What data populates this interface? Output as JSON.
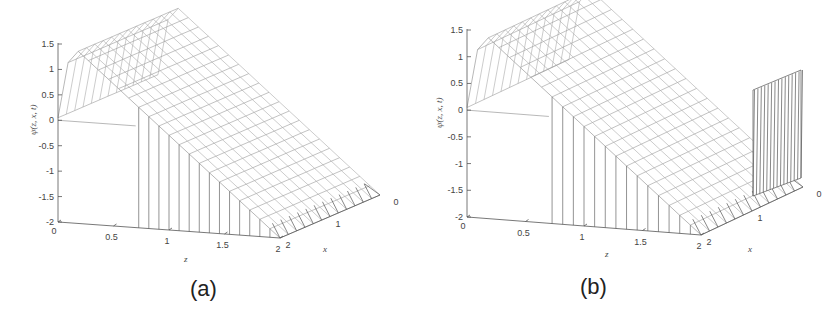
{
  "chart_data": [
    {
      "type": "surface",
      "panel_label": "(a)",
      "title": "",
      "zlabel": "ψ(z, x, t)",
      "xlabel": "z",
      "ylabel": "x",
      "z_axis_ticks": [
        "1.5",
        "1",
        "0.5",
        "0",
        "-0.5",
        "-1",
        "-1.5",
        "-2"
      ],
      "z_range": [
        -2,
        1.5
      ],
      "x_axis_ticks": [
        "0",
        "0.5",
        "1",
        "1.5",
        "2"
      ],
      "x_range": [
        0,
        2
      ],
      "depth_axis_ticks": [
        "2",
        "1",
        "0"
      ],
      "depth_range": [
        0,
        2
      ],
      "description": "Wireframe surface: flat plateau near ψ≈1.5 at small z falling linearly to about ψ≈-2 at z≈2, with a ramp front face; uniform along x."
    },
    {
      "type": "surface",
      "panel_label": "(b)",
      "title": "",
      "zlabel": "ψ(z, x, t)",
      "xlabel": "z",
      "ylabel": "x",
      "z_axis_ticks": [
        "1.5",
        "1",
        "0.5",
        "0",
        "-0.5",
        "-1",
        "-1.5",
        "-2"
      ],
      "z_range": [
        -2,
        1.5
      ],
      "x_axis_ticks": [
        "0",
        "0.5",
        "1",
        "1.5",
        "2"
      ],
      "x_range": [
        0,
        2
      ],
      "depth_axis_ticks": [
        "2",
        "1",
        "0"
      ],
      "depth_range": [
        0,
        2
      ],
      "description": "Same wireframe surface as (a) but with a vertical spike near z=2 for x between 0 and 1 reaching about ψ≈0.5-1."
    }
  ],
  "captions": {
    "a": "(a)",
    "b": "(b)"
  },
  "axes": {
    "zlabel": "ψ(z, x, t)",
    "xlabel": "z",
    "ylabel": "x",
    "z_ticks": [
      "1.5",
      "1",
      "0.5",
      "0",
      "-0.5",
      "-1",
      "-1.5",
      "-2"
    ],
    "x_ticks": [
      "0",
      "0.5",
      "1",
      "1.5",
      "2"
    ],
    "depth_ticks": [
      "2",
      "1",
      "0"
    ]
  }
}
